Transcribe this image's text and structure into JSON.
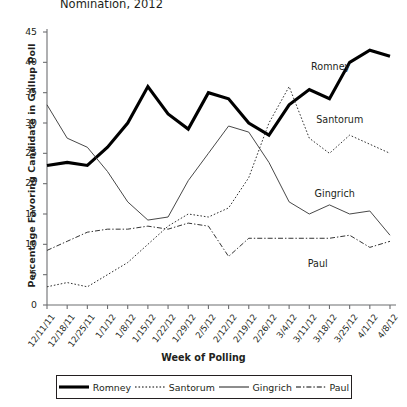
{
  "chart_data": {
    "type": "line",
    "title": "Nomination, 2012",
    "xlabel": "Week of Polling",
    "ylabel": "Percentage Favoring Candidate in Gallup Poll",
    "ylim": [
      0,
      45
    ],
    "ytick_step": 5,
    "grid": false,
    "legend_position": "bottom",
    "yticks": [
      "0",
      "5",
      "10",
      "15",
      "20",
      "25",
      "30",
      "35",
      "40",
      "45"
    ],
    "categories": [
      "12/11/11",
      "12/18/11",
      "12/25/11",
      "1/1/12",
      "1/8/12",
      "1/15/12",
      "1/22/12",
      "1/29/12",
      "2/5/12",
      "2/12/12",
      "2/19/12",
      "2/26/12",
      "3/4/12",
      "3/11/12",
      "3/18/12",
      "3/25/12",
      "4/1/12",
      "4/8/12"
    ],
    "series": [
      {
        "name": "Romney",
        "style": "thick-solid",
        "color": "#000000",
        "values": [
          23,
          23.5,
          23,
          26,
          30,
          36,
          31.5,
          29,
          35,
          34,
          30,
          28,
          33,
          35.5,
          34,
          40,
          42,
          41
        ]
      },
      {
        "name": "Santorum",
        "style": "dotted",
        "color": "#333333",
        "values": [
          3,
          3.7,
          3,
          5,
          7,
          10,
          13,
          15,
          14.5,
          16,
          21,
          30,
          36,
          27.5,
          25,
          28,
          26.5,
          25
        ]
      },
      {
        "name": "Gingrich",
        "style": "thin-solid",
        "color": "#333333",
        "values": [
          33,
          27.5,
          26,
          22,
          17,
          14,
          14.5,
          20.5,
          25,
          29.5,
          28.5,
          23.5,
          17,
          15,
          16.5,
          15,
          15.5,
          11.5
        ]
      },
      {
        "name": "Paul",
        "style": "dash-dot",
        "color": "#333333",
        "values": [
          9,
          10.5,
          12,
          12.5,
          12.5,
          13,
          12.5,
          13.5,
          13,
          8,
          11,
          11,
          11,
          11,
          11,
          11.5,
          9.5,
          10.5
        ]
      }
    ],
    "annotations": [
      {
        "label": "Romney",
        "x_pct": 77.0,
        "y_value": 39.0
      },
      {
        "label": "Santorum",
        "x_pct": 78.5,
        "y_value": 30.3
      },
      {
        "label": "Gingrich",
        "x_pct": 78.0,
        "y_value": 18.2
      },
      {
        "label": "Paul",
        "x_pct": 76.0,
        "y_value": 6.6
      }
    ]
  },
  "legend": {
    "entries": [
      {
        "label": "Romney",
        "style": "thick-solid"
      },
      {
        "label": "Santorum",
        "style": "dotted"
      },
      {
        "label": "Gingrich",
        "style": "thin-solid"
      },
      {
        "label": "Paul",
        "style": "dash-dot"
      }
    ]
  }
}
